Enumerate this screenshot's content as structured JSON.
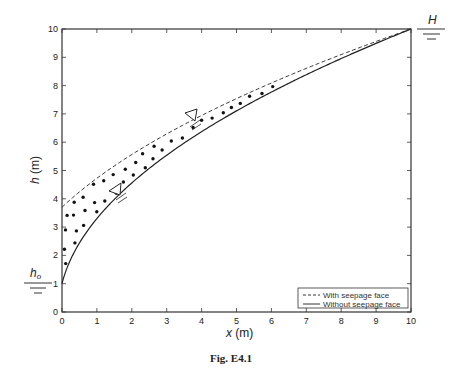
{
  "figure": {
    "caption": "Fig. E4.1",
    "annotations": {
      "top_right_water_level": "H",
      "left_water_level": "h",
      "left_water_level_sub": "o"
    }
  },
  "chart_data": {
    "type": "line",
    "title": "",
    "xlabel": "x (m)",
    "ylabel": "h (m)",
    "xlabel_var": "x",
    "xlabel_unit": "(m)",
    "ylabel_var": "h",
    "ylabel_unit": "(m)",
    "xlim": [
      0,
      10
    ],
    "ylim": [
      0,
      10
    ],
    "xticks": [
      "0",
      "1",
      "2",
      "3",
      "4",
      "5",
      "6",
      "7",
      "8",
      "9",
      "10"
    ],
    "yticks": [
      "0",
      "1",
      "2",
      "3",
      "4",
      "5",
      "6",
      "7",
      "8",
      "9",
      "10"
    ],
    "grid": false,
    "legend_position": "lower right",
    "legend": [
      "With seepage face",
      "Without seepage face"
    ],
    "x": [
      0,
      0.5,
      1,
      1.5,
      2,
      2.5,
      3,
      3.5,
      4,
      4.5,
      5,
      5.5,
      6,
      6.5,
      7,
      7.5,
      8,
      8.5,
      9,
      9.5,
      10
    ],
    "series": [
      {
        "name": "With seepage face",
        "style": "dashed",
        "values": [
          3.7,
          4.28,
          4.8,
          5.27,
          5.7,
          6.1,
          6.47,
          6.83,
          7.17,
          7.49,
          7.8,
          8.1,
          8.39,
          8.67,
          8.94,
          9.2,
          9.46,
          9.7,
          9.77,
          9.89,
          10.0
        ]
      },
      {
        "name": "Without seepage face",
        "style": "solid",
        "values": [
          1.0,
          2.44,
          3.31,
          3.99,
          4.56,
          5.07,
          5.54,
          5.97,
          6.37,
          6.75,
          7.11,
          7.45,
          7.77,
          8.09,
          8.39,
          8.68,
          8.96,
          9.23,
          9.49,
          9.75,
          10.0
        ]
      }
    ],
    "annotations": [
      {
        "text": "H",
        "position": "top right, water level marker at h=10"
      },
      {
        "text": "h_o",
        "position": "left, water level marker at h=1"
      },
      {
        "text": "free surface markers (inverted triangles) on both curves"
      },
      {
        "text": "dotted region between curves = seepage face zone"
      }
    ]
  }
}
